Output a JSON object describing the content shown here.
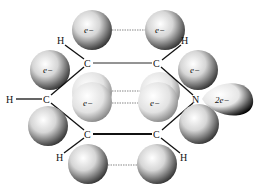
{
  "diagram": {
    "molecule": "pyridine",
    "colors": {
      "bond": "#111111",
      "dashed_overlap": "#888888",
      "sphere_light": "#ffffff",
      "sphere_dark": "#3a3a3a",
      "lone_pair_dark": "#000000"
    },
    "atoms": [
      {
        "id": "H1",
        "symbol": "H",
        "x": 61,
        "y": 41
      },
      {
        "id": "C1",
        "symbol": "C",
        "x": 88,
        "y": 63
      },
      {
        "id": "C2",
        "symbol": "C",
        "x": 157,
        "y": 63
      },
      {
        "id": "H2",
        "symbol": "H",
        "x": 185,
        "y": 41
      },
      {
        "id": "H3",
        "symbol": "H",
        "x": 11,
        "y": 99
      },
      {
        "id": "C3",
        "symbol": "C",
        "x": 47,
        "y": 99
      },
      {
        "id": "N",
        "symbol": "N",
        "x": 197,
        "y": 99
      },
      {
        "id": "C4",
        "symbol": "C",
        "x": 88,
        "y": 134
      },
      {
        "id": "C5",
        "symbol": "C",
        "x": 157,
        "y": 134
      },
      {
        "id": "H4",
        "symbol": "H",
        "x": 60,
        "y": 157
      },
      {
        "id": "H5",
        "symbol": "H",
        "x": 184,
        "y": 157
      }
    ],
    "electron_labels": {
      "top_left": "e−",
      "top_right": "e−",
      "upper_left": "e−",
      "upper_right": "e−",
      "middle_left": "e−",
      "middle_right": "e−",
      "lone_pair": "2e−"
    }
  }
}
